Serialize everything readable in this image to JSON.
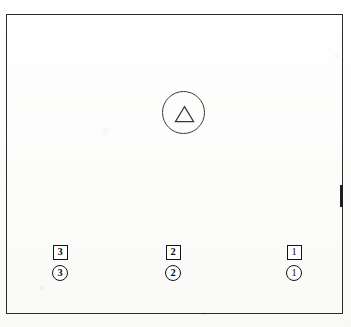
{
  "figure": {
    "frame": {
      "name": "outer-rectangle",
      "stroke_color": "#2a2a2a"
    },
    "symbol": {
      "name": "circle-with-triangle",
      "outer_shape": "circle",
      "inner_shape": "triangle",
      "label": "",
      "stroke_color": "#3a3a3a"
    },
    "markers": [
      {
        "id": "3",
        "square_label": "3",
        "circle_label": "3",
        "position": "left"
      },
      {
        "id": "2",
        "square_label": "2",
        "circle_label": "2",
        "position": "center"
      },
      {
        "id": "1",
        "square_label": "1",
        "circle_label": "1",
        "position": "right"
      }
    ]
  },
  "colors": {
    "ink": "#141414",
    "frame": "#2a2a2a",
    "paper": "#fdfdfc"
  }
}
